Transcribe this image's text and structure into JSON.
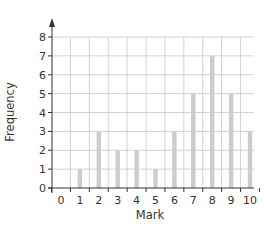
{
  "chart_data": {
    "type": "bar",
    "title": "",
    "xlabel": "Mark",
    "ylabel": "Frequency",
    "categories": [
      "0",
      "1",
      "2",
      "3",
      "4",
      "5",
      "6",
      "7",
      "8",
      "9",
      "10"
    ],
    "values": [
      0,
      1,
      3,
      2,
      2,
      1,
      3,
      5,
      7,
      5,
      3
    ],
    "ylim": [
      0,
      8
    ],
    "yticks": [
      "0",
      "1",
      "2",
      "3",
      "4",
      "5",
      "6",
      "7",
      "8"
    ],
    "grid": true,
    "legend": null,
    "colors": {
      "bar": "#cccccc",
      "grid": "#c8c8c8",
      "axis": "#333333"
    }
  }
}
